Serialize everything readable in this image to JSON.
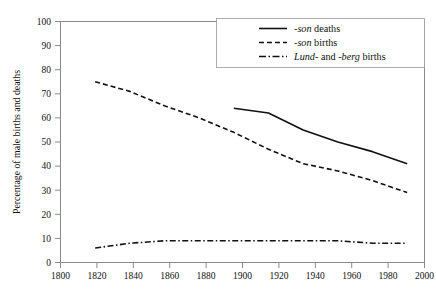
{
  "chart_data": {
    "type": "line",
    "title": "",
    "xlabel": "",
    "ylabel": "Percentage of male births and deaths",
    "xlim": [
      1800,
      2010
    ],
    "ylim": [
      0,
      100
    ],
    "grid": false,
    "legend_position": "top-right",
    "x_ticks": [
      "1800",
      "1820",
      "1840",
      "1860",
      "1880",
      "1900",
      "1920",
      "1940",
      "1960",
      "1980",
      "2000"
    ],
    "y_ticks": [
      "0",
      "10",
      "20",
      "30",
      "40",
      "50",
      "60",
      "70",
      "80",
      "90",
      "100"
    ],
    "series": [
      {
        "name": "-son deaths",
        "style": "solid",
        "x": [
          1900,
          1920,
          1940,
          1960,
          1980,
          2000
        ],
        "values": [
          64,
          62,
          55,
          50,
          46,
          41
        ]
      },
      {
        "name": "-son births",
        "style": "dashed",
        "x": [
          1820,
          1840,
          1860,
          1880,
          1900,
          1920,
          1940,
          1960,
          1980,
          2000
        ],
        "values": [
          75,
          71,
          65,
          60,
          54,
          47,
          41,
          38,
          34,
          29
        ]
      },
      {
        "name": "Lund- and -berg births",
        "style": "dash-dot",
        "x": [
          1820,
          1840,
          1860,
          1880,
          1900,
          1920,
          1940,
          1960,
          1980,
          2000
        ],
        "values": [
          6,
          8,
          9,
          9,
          9,
          9,
          9,
          9,
          8,
          8
        ]
      }
    ]
  },
  "legend": {
    "items": [
      {
        "name": "legend-item-son-deaths",
        "prefix": "-",
        "italic": "son",
        "suffix": " deaths",
        "style": "solid"
      },
      {
        "name": "legend-item-son-births",
        "prefix": "-",
        "italic": "son",
        "suffix": " births",
        "style": "dashed"
      },
      {
        "name": "legend-item-lund-berg-births",
        "prefix": "",
        "italic": "Lund",
        "mid": "- and -",
        "italic2": "berg",
        "suffix": " births",
        "style": "dash-dot"
      }
    ]
  },
  "axes": {
    "y_title": "Percentage of male births and deaths"
  }
}
